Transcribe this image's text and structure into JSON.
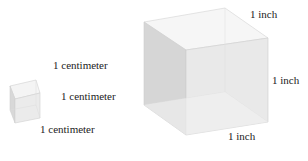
{
  "small_cube": {
    "top_label": "1 centimeter",
    "right_label": "1 centimeter",
    "bottom_label": "1 centimeter"
  },
  "large_cube": {
    "top_label": "1 inch",
    "right_label": "1 inch",
    "bottom_label": "1 inch"
  },
  "colors": {
    "face_light": "#f2f2f2",
    "face_mid": "#e6e6e6",
    "face_dark": "#d4d4d4",
    "edge": "#c8c8c8",
    "text": "#222222"
  }
}
